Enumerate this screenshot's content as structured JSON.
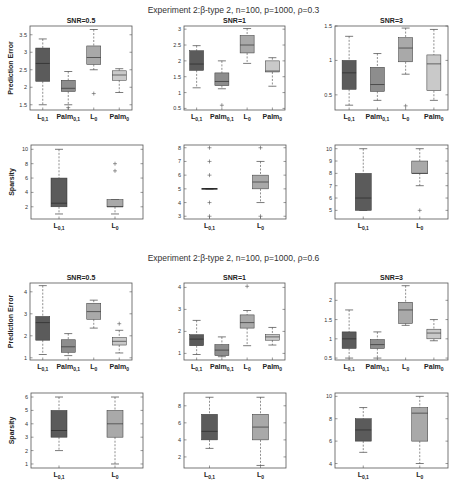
{
  "colors": {
    "L01": "#5b5b5b",
    "Palm01": "#8d8d8d",
    "L0": "#a9a9a9",
    "Palm0": "#c9c9c9",
    "axis": "#555555",
    "whisker": "#444444"
  },
  "blocks": [
    {
      "title": "Experiment 2:β-type 2,  n=100, p=1000, ρ=0.3",
      "title_y": 11
    },
    {
      "title": "Experiment 2:β-type 2,  n=100, p=1000, ρ=0.6",
      "title_y": 259
    }
  ],
  "chart_data": [
    {
      "type": "box",
      "block": 0,
      "title": "SNR=0.5",
      "ylabel": "Prediction Error",
      "rect": [
        30,
        26,
        102,
        84
      ],
      "ylim": [
        1.35,
        3.75
      ],
      "yticks": [
        1.5,
        2,
        2.5,
        3,
        3.5
      ],
      "categories": [
        "L0,1",
        "Palm0,1",
        "L0",
        "Palm0"
      ],
      "colorkeys": [
        "L01",
        "Palm01",
        "L0",
        "Palm0"
      ],
      "boxes": [
        {
          "wlo": 1.5,
          "q1": 2.17,
          "med": 2.68,
          "q3": 3.12,
          "whi": 3.38,
          "out": []
        },
        {
          "wlo": 1.5,
          "q1": 1.88,
          "med": 1.97,
          "q3": 2.2,
          "whi": 2.45,
          "out": [
            1.42
          ]
        },
        {
          "wlo": 2.5,
          "q1": 2.65,
          "med": 2.85,
          "q3": 3.18,
          "whi": 3.65,
          "out": [
            1.82
          ]
        },
        {
          "wlo": 1.85,
          "q1": 2.2,
          "med": 2.35,
          "q3": 2.47,
          "whi": 2.53,
          "out": []
        }
      ]
    },
    {
      "type": "box",
      "block": 0,
      "title": "SNR=1",
      "rect": [
        184,
        26,
        101,
        84
      ],
      "ylim": [
        0.45,
        3.1
      ],
      "yticks": [
        0.5,
        1,
        1.5,
        2,
        2.5,
        3
      ],
      "categories": [
        "L0,1",
        "Palm0,1",
        "L0",
        "Palm0"
      ],
      "colorkeys": [
        "L01",
        "Palm01",
        "L0",
        "Palm0"
      ],
      "boxes": [
        {
          "wlo": 1.15,
          "q1": 1.7,
          "med": 1.9,
          "q3": 2.32,
          "whi": 2.48,
          "out": []
        },
        {
          "wlo": 1.12,
          "q1": 1.22,
          "med": 1.35,
          "q3": 1.62,
          "whi": 2.0,
          "out": [
            0.6
          ]
        },
        {
          "wlo": 1.92,
          "q1": 2.25,
          "med": 2.5,
          "q3": 2.8,
          "whi": 3.02,
          "out": []
        },
        {
          "wlo": 1.2,
          "q1": 1.65,
          "med": 1.68,
          "q3": 2.0,
          "whi": 2.1,
          "out": []
        }
      ]
    },
    {
      "type": "box",
      "block": 0,
      "title": "SNR=3",
      "rect": [
        335,
        26,
        113,
        84
      ],
      "ylim": [
        0.28,
        1.5
      ],
      "yticks": [
        0.5,
        1,
        1.5
      ],
      "categories": [
        "L0,1",
        "Palm0,1",
        "L0",
        "Palm0"
      ],
      "colorkeys": [
        "L01",
        "Palm01",
        "L0",
        "Palm0"
      ],
      "boxes": [
        {
          "wlo": 0.35,
          "q1": 0.58,
          "med": 0.82,
          "q3": 1.0,
          "whi": 1.35,
          "out": []
        },
        {
          "wlo": 0.42,
          "q1": 0.55,
          "med": 0.65,
          "q3": 0.9,
          "whi": 1.1,
          "out": []
        },
        {
          "wlo": 0.8,
          "q1": 0.98,
          "med": 1.18,
          "q3": 1.33,
          "whi": 1.47,
          "out": [
            0.34
          ]
        },
        {
          "wlo": 0.42,
          "q1": 0.56,
          "med": 0.95,
          "q3": 1.08,
          "whi": 1.45,
          "out": []
        }
      ]
    },
    {
      "type": "box",
      "block": 0,
      "title": "",
      "ylabel": "Sparsity",
      "rect": [
        31,
        145,
        112,
        74
      ],
      "ylim": [
        0.3,
        10.6
      ],
      "yticks": [
        2,
        4,
        6,
        8,
        10
      ],
      "categories": [
        "L0,1",
        "L0"
      ],
      "colorkeys": [
        "L01",
        "L0"
      ],
      "boxes": [
        {
          "wlo": 1,
          "q1": 2,
          "med": 2.5,
          "q3": 6,
          "whi": 10,
          "out": []
        },
        {
          "wlo": 1,
          "q1": 2,
          "med": 2,
          "q3": 3,
          "whi": 3,
          "out": [
            7,
            8
          ]
        }
      ]
    },
    {
      "type": "box",
      "block": 0,
      "title": "",
      "rect": [
        184,
        145,
        102,
        74
      ],
      "ylim": [
        2.8,
        8.2
      ],
      "yticks": [
        3,
        4,
        5,
        6,
        7,
        8
      ],
      "categories": [
        "L0,1",
        "L0"
      ],
      "colorkeys": [
        "L01",
        "L0"
      ],
      "boxes": [
        {
          "wlo": 5,
          "q1": 5,
          "med": 5,
          "q3": 5,
          "whi": 5,
          "out": [
            3,
            4,
            6,
            7,
            8
          ]
        },
        {
          "wlo": 4,
          "q1": 5,
          "med": 5.5,
          "q3": 6,
          "whi": 7,
          "out": [
            3,
            8
          ]
        }
      ]
    },
    {
      "type": "box",
      "block": 0,
      "title": "",
      "rect": [
        335,
        145,
        113,
        74
      ],
      "ylim": [
        4.3,
        10.3
      ],
      "yticks": [
        5,
        6,
        7,
        8,
        9,
        10
      ],
      "categories": [
        "L0,1",
        "L0"
      ],
      "colorkeys": [
        "L01",
        "L0"
      ],
      "boxes": [
        {
          "wlo": 5,
          "q1": 5,
          "med": 6,
          "q3": 8,
          "whi": 10,
          "out": []
        },
        {
          "wlo": 7,
          "q1": 8,
          "med": 8,
          "q3": 9,
          "whi": 10,
          "out": [
            5
          ]
        }
      ]
    },
    {
      "type": "box",
      "block": 1,
      "title": "SNR=0.5",
      "ylabel": "Prediction Error",
      "rect": [
        30,
        283,
        102,
        77
      ],
      "ylim": [
        0.9,
        4.4
      ],
      "yticks": [
        1,
        2,
        3,
        4
      ],
      "categories": [
        "L0,1",
        "Palm0,1",
        "L0",
        "Palm0"
      ],
      "colorkeys": [
        "L01",
        "Palm01",
        "L0",
        "Palm0"
      ],
      "boxes": [
        {
          "wlo": 1.15,
          "q1": 1.8,
          "med": 2.6,
          "q3": 2.88,
          "whi": 4.28,
          "out": []
        },
        {
          "wlo": 1.1,
          "q1": 1.25,
          "med": 1.5,
          "q3": 1.82,
          "whi": 2.1,
          "out": []
        },
        {
          "wlo": 2.35,
          "q1": 2.75,
          "med": 3.1,
          "q3": 3.48,
          "whi": 3.62,
          "out": []
        },
        {
          "wlo": 1.22,
          "q1": 1.58,
          "med": 1.75,
          "q3": 1.92,
          "whi": 2.25,
          "out": [
            2.55
          ]
        }
      ]
    },
    {
      "type": "box",
      "block": 1,
      "title": "SNR=1",
      "rect": [
        184,
        283,
        101,
        77
      ],
      "ylim": [
        0.7,
        4.2
      ],
      "yticks": [
        1,
        2,
        3,
        4
      ],
      "categories": [
        "L0,1",
        "Palm0,1",
        "L0",
        "Palm0"
      ],
      "colorkeys": [
        "L01",
        "Palm01",
        "L0",
        "Palm0"
      ],
      "boxes": [
        {
          "wlo": 0.95,
          "q1": 1.35,
          "med": 1.65,
          "q3": 1.85,
          "whi": 2.5,
          "out": []
        },
        {
          "wlo": 0.85,
          "q1": 0.9,
          "med": 1.15,
          "q3": 1.4,
          "whi": 1.75,
          "out": []
        },
        {
          "wlo": 1.35,
          "q1": 2.15,
          "med": 2.4,
          "q3": 2.75,
          "whi": 2.95,
          "out": [
            4.05
          ]
        },
        {
          "wlo": 1.38,
          "q1": 1.6,
          "med": 1.75,
          "q3": 1.85,
          "whi": 2.18,
          "out": []
        }
      ]
    },
    {
      "type": "box",
      "block": 1,
      "title": "SNR=3",
      "rect": [
        335,
        283,
        113,
        77
      ],
      "ylim": [
        0.45,
        2.45
      ],
      "yticks": [
        0.5,
        1,
        1.5,
        2
      ],
      "categories": [
        "L0,1",
        "Palm0,1",
        "L0",
        "Palm0"
      ],
      "colorkeys": [
        "L01",
        "Palm01",
        "L0",
        "Palm0"
      ],
      "boxes": [
        {
          "wlo": 0.5,
          "q1": 0.75,
          "med": 1.0,
          "q3": 1.18,
          "whi": 1.75,
          "out": []
        },
        {
          "wlo": 0.5,
          "q1": 0.75,
          "med": 0.85,
          "q3": 0.98,
          "whi": 1.18,
          "out": []
        },
        {
          "wlo": 1.35,
          "q1": 1.4,
          "med": 1.75,
          "q3": 1.95,
          "whi": 2.38,
          "out": []
        },
        {
          "wlo": 0.95,
          "q1": 1.0,
          "med": 1.15,
          "q3": 1.25,
          "whi": 1.5,
          "out": []
        }
      ]
    },
    {
      "type": "box",
      "block": 1,
      "title": "",
      "ylabel": "Sparsity",
      "rect": [
        31,
        393,
        112,
        75
      ],
      "ylim": [
        0.7,
        6.3
      ],
      "yticks": [
        1,
        2,
        3,
        4,
        5,
        6
      ],
      "categories": [
        "L0,1",
        "L0"
      ],
      "colorkeys": [
        "L01",
        "L0"
      ],
      "boxes": [
        {
          "wlo": 2,
          "q1": 3,
          "med": 3.5,
          "q3": 5,
          "whi": 6,
          "out": []
        },
        {
          "wlo": 1,
          "q1": 3,
          "med": 4,
          "q3": 5,
          "whi": 6,
          "out": []
        }
      ]
    },
    {
      "type": "box",
      "block": 1,
      "title": "",
      "rect": [
        184,
        393,
        102,
        75
      ],
      "ylim": [
        0.7,
        9.5
      ],
      "yticks": [
        2,
        4,
        6,
        8
      ],
      "categories": [
        "L0,1",
        "L0"
      ],
      "colorkeys": [
        "L01",
        "L0"
      ],
      "boxes": [
        {
          "wlo": 3,
          "q1": 4,
          "med": 5,
          "q3": 7,
          "whi": 9,
          "out": []
        },
        {
          "wlo": 1,
          "q1": 4,
          "med": 5.5,
          "q3": 7,
          "whi": 9,
          "out": []
        }
      ]
    },
    {
      "type": "box",
      "block": 1,
      "title": "",
      "rect": [
        335,
        393,
        113,
        75
      ],
      "ylim": [
        3.6,
        10.3
      ],
      "yticks": [
        4,
        6,
        8,
        10
      ],
      "categories": [
        "L0,1",
        "L0"
      ],
      "colorkeys": [
        "L01",
        "L0"
      ],
      "boxes": [
        {
          "wlo": 5,
          "q1": 6,
          "med": 7,
          "q3": 8,
          "whi": 9,
          "out": []
        },
        {
          "wlo": 4,
          "q1": 6,
          "med": 8.5,
          "q3": 9,
          "whi": 10,
          "out": []
        }
      ]
    }
  ]
}
